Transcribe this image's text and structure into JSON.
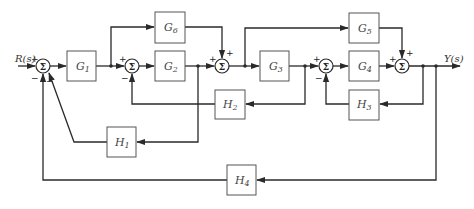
{
  "diagram": {
    "type": "block-diagram",
    "input_label": "R(s)",
    "output_label": "Y(s)",
    "sum_symbol": "Σ",
    "blocks": {
      "G1": {
        "base": "G",
        "sub": "1"
      },
      "G2": {
        "base": "G",
        "sub": "2"
      },
      "G3": {
        "base": "G",
        "sub": "3"
      },
      "G4": {
        "base": "G",
        "sub": "4"
      },
      "G5": {
        "base": "G",
        "sub": "5"
      },
      "G6": {
        "base": "G",
        "sub": "6"
      },
      "H1": {
        "base": "H",
        "sub": "1"
      },
      "H2": {
        "base": "H",
        "sub": "2"
      },
      "H3": {
        "base": "H",
        "sub": "3"
      },
      "H4": {
        "base": "H",
        "sub": "4"
      }
    },
    "signs": {
      "s1_in": "+",
      "s1_fb1": "−",
      "s1_fb2": "−",
      "s2_in": "+",
      "s2_fb": "−",
      "s3_in": "+",
      "s3_top": "+",
      "s4_in": "+",
      "s4_fb": "−",
      "s5_in": "+",
      "s5_top": "+"
    }
  }
}
